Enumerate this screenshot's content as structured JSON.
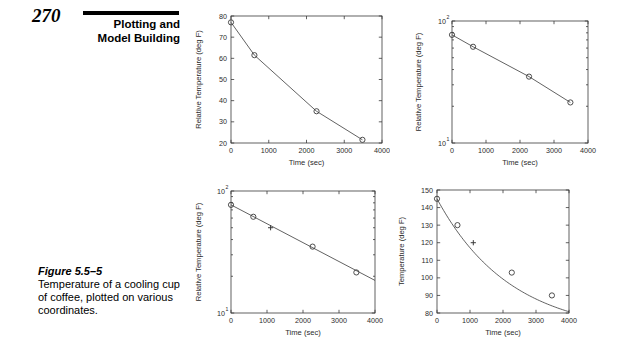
{
  "header": {
    "page_number": "270",
    "title_line1": "Plotting and",
    "title_line2": "Model Building"
  },
  "caption": {
    "label": "Figure 5.5–5",
    "text": "Temperature of a cooling cup of coffee, plotted on various coordinates."
  },
  "chart_data": [
    {
      "id": "top-left",
      "type": "line",
      "title": "",
      "xlabel": "Time (sec)",
      "ylabel": "Relative Temperature (deg F)",
      "xscale": "linear",
      "yscale": "linear",
      "xlim": [
        0,
        4000
      ],
      "ylim": [
        20,
        80
      ],
      "xticks": [
        0,
        1000,
        2000,
        3000,
        4000
      ],
      "xticklabels": [
        "0",
        "1000",
        "2000",
        "3000",
        "4000"
      ],
      "yticks": [
        20,
        30,
        40,
        50,
        60,
        70,
        80
      ],
      "yticklabels": [
        "20",
        "30",
        "40",
        "50",
        "60",
        "70",
        "80"
      ],
      "grid": false,
      "legend": "none",
      "series": [
        {
          "name": "relative temperature data",
          "marker": "o",
          "x": [
            0,
            620,
            2266,
            3482
          ],
          "y": [
            77,
            61.5,
            35,
            21.5
          ]
        }
      ]
    },
    {
      "id": "top-right",
      "type": "line",
      "title": "",
      "xlabel": "Time (sec)",
      "ylabel": "Relative Temperature (deg F)",
      "xscale": "linear",
      "yscale": "log",
      "xlim": [
        0,
        4000
      ],
      "ylim": [
        10,
        100
      ],
      "xticks": [
        0,
        1000,
        2000,
        3000,
        4000
      ],
      "xticklabels": [
        "0",
        "1000",
        "2000",
        "3000",
        "4000"
      ],
      "yticks": [
        10,
        100
      ],
      "yticklabels": [
        "10¹",
        "10²"
      ],
      "grid": false,
      "legend": "none",
      "series": [
        {
          "name": "relative temperature data",
          "marker": "o",
          "x": [
            0,
            620,
            2266,
            3482
          ],
          "y": [
            77,
            61.5,
            35,
            21.5
          ]
        }
      ]
    },
    {
      "id": "bottom-left",
      "type": "line",
      "title": "",
      "xlabel": "Time (sec)",
      "ylabel": "Relative Temperature (deg F)",
      "xscale": "linear",
      "yscale": "log",
      "xlim": [
        0,
        4000
      ],
      "ylim": [
        10,
        100
      ],
      "xticks": [
        0,
        1000,
        2000,
        3000,
        4000
      ],
      "xticklabels": [
        "0",
        "1000",
        "2000",
        "3000",
        "4000"
      ],
      "yticks": [
        10,
        100
      ],
      "yticklabels": [
        "10¹",
        "10²"
      ],
      "grid": false,
      "legend": "none",
      "series": [
        {
          "name": "data points",
          "marker": "o",
          "x": [
            0,
            620,
            2266,
            3482
          ],
          "y": [
            77,
            61.5,
            35,
            21.5
          ]
        },
        {
          "name": "extra point",
          "marker": "+",
          "x": [
            1100
          ],
          "y": [
            50
          ]
        },
        {
          "name": "fitted line",
          "marker": "none",
          "x": [
            0,
            4000
          ],
          "y": [
            77,
            18.5
          ]
        }
      ]
    },
    {
      "id": "bottom-right",
      "type": "line",
      "title": "",
      "xlabel": "Time (sec)",
      "ylabel": "Temperature (deg F)",
      "xscale": "linear",
      "yscale": "linear",
      "xlim": [
        0,
        4000
      ],
      "ylim": [
        80,
        150
      ],
      "xticks": [
        0,
        1000,
        2000,
        3000,
        4000
      ],
      "xticklabels": [
        "0",
        "1000",
        "2000",
        "3000",
        "4000"
      ],
      "yticks": [
        80,
        90,
        100,
        110,
        120,
        130,
        140,
        150
      ],
      "yticklabels": [
        "80",
        "90",
        "100",
        "110",
        "120",
        "130",
        "140",
        "150"
      ],
      "grid": false,
      "legend": "none",
      "series": [
        {
          "name": "absolute temperature data",
          "marker": "o",
          "x": [
            0,
            620,
            2266,
            3482
          ],
          "y": [
            145,
            130,
            103,
            90
          ]
        },
        {
          "name": "extra point",
          "marker": "+",
          "x": [
            1100
          ],
          "y": [
            120
          ]
        },
        {
          "name": "fitted curve",
          "marker": "none",
          "x": [
            0,
            4000
          ],
          "y": [
            145,
            86
          ]
        }
      ]
    }
  ]
}
